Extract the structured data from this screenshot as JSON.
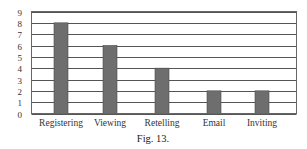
{
  "chart_data": {
    "type": "bar",
    "title": "",
    "caption": "Fig. 13.",
    "xlabel": "",
    "ylabel": "",
    "categories": [
      "Registering",
      "Viewing",
      "Retelling",
      "Email",
      "Inviting"
    ],
    "values": [
      8,
      6,
      4,
      2,
      2
    ],
    "ylim": [
      0,
      9
    ],
    "yticks": [
      0,
      1,
      2,
      3,
      4,
      5,
      6,
      7,
      8,
      9
    ],
    "grid": true,
    "legend": null,
    "bar_color": "#6e6e6e"
  }
}
